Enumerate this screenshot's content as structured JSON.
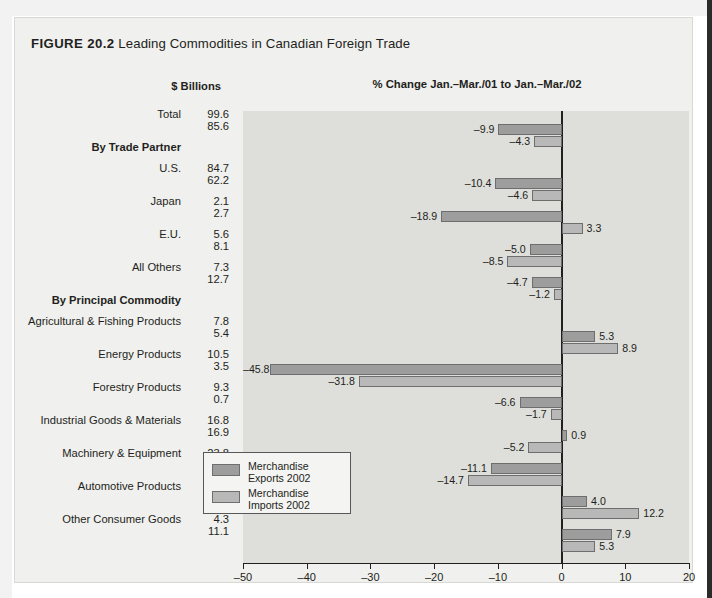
{
  "figure": {
    "number": "FIGURE 20.2",
    "title": "Leading Commodities in Canadian Foreign Trade",
    "chart_header": "% Change  Jan.–Mar./01 to Jan.–Mar./02",
    "units_header": "$ Billions"
  },
  "legend": {
    "position": "inside-left",
    "items": [
      {
        "label_line1": "Merchandise",
        "label_line2": "Exports 2002",
        "color": "#9d9d9d",
        "key": "exports"
      },
      {
        "label_line1": "Merchandise",
        "label_line2": "Imports 2002",
        "color": "#b8b8b8",
        "key": "imports"
      }
    ]
  },
  "chart_data": {
    "type": "bar",
    "orientation": "horizontal",
    "title": "Leading Commodities in Canadian Foreign Trade",
    "subtitle": "% Change  Jan.–Mar./01 to Jan.–Mar./02",
    "xlabel": "",
    "ylabel": "",
    "xlim": [
      -50,
      20
    ],
    "xticks": [
      -50,
      -40,
      -30,
      -20,
      -10,
      0,
      10,
      20
    ],
    "xticklabels": [
      "–50",
      "–40",
      "–30",
      "–20",
      "–10",
      "0",
      "10",
      "20"
    ],
    "grid": false,
    "legend_position": "inside-left",
    "value_column_header": "$ Billions",
    "series": [
      {
        "name": "Merchandise Exports 2002",
        "color": "#9d9d9d"
      },
      {
        "name": "Merchandise Imports 2002",
        "color": "#b8b8b8"
      }
    ],
    "sections": [
      {
        "heading": "",
        "rows": [
          {
            "category": "Total",
            "billions_exports": "99.6",
            "billions_imports": "85.6",
            "pct_exports": -9.9,
            "pct_imports": -4.3,
            "label_exports": "–9.9",
            "label_imports": "–4.3"
          }
        ]
      },
      {
        "heading": "By Trade Partner",
        "rows": [
          {
            "category": "U.S.",
            "billions_exports": "84.7",
            "billions_imports": "62.2",
            "pct_exports": -10.4,
            "pct_imports": -4.6,
            "label_exports": "–10.4",
            "label_imports": "–4.6"
          },
          {
            "category": "Japan",
            "billions_exports": "2.1",
            "billions_imports": "2.7",
            "pct_exports": -18.9,
            "pct_imports": 3.3,
            "label_exports": "–18.9",
            "label_imports": "3.3"
          },
          {
            "category": "E.U.",
            "billions_exports": "5.6",
            "billions_imports": "8.1",
            "pct_exports": -5.0,
            "pct_imports": -8.5,
            "label_exports": "–5.0",
            "label_imports": "–8.5"
          },
          {
            "category": "All Others",
            "billions_exports": "7.3",
            "billions_imports": "12.7",
            "pct_exports": -4.7,
            "pct_imports": -1.2,
            "label_exports": "–4.7",
            "label_imports": "–1.2"
          }
        ]
      },
      {
        "heading": "By Principal Commodity",
        "rows": [
          {
            "category": "Agricultural & Fishing Products",
            "billions_exports": "7.8",
            "billions_imports": "5.4",
            "pct_exports": 5.3,
            "pct_imports": 8.9,
            "label_exports": "5.3",
            "label_imports": "8.9"
          },
          {
            "category": "Energy Products",
            "billions_exports": "10.5",
            "billions_imports": "3.5",
            "pct_exports": -45.8,
            "pct_imports": -31.8,
            "label_exports": "–45.8",
            "label_imports": "–31.8"
          },
          {
            "category": "Forestry Products",
            "billions_exports": "9.3",
            "billions_imports": "0.7",
            "pct_exports": -6.6,
            "pct_imports": -1.7,
            "label_exports": "–6.6",
            "label_imports": "–1.7"
          },
          {
            "category": "Industrial Goods & Materials",
            "billions_exports": "16.8",
            "billions_imports": "16.9",
            "pct_exports": 0.9,
            "pct_imports": -5.2,
            "label_exports": "0.9",
            "label_imports": "–5.2"
          },
          {
            "category": "Machinery & Equipment",
            "billions_exports": "23.8",
            "billions_imports": "25.7",
            "pct_exports": -11.1,
            "pct_imports": -14.7,
            "label_exports": "–11.1",
            "label_imports": "–14.7"
          },
          {
            "category": "Automotive Products",
            "billions_exports": "23.4",
            "billions_imports": "19.1",
            "pct_exports": 4.0,
            "pct_imports": 12.2,
            "label_exports": "4.0",
            "label_imports": "12.2"
          },
          {
            "category": "Other Consumer Goods",
            "billions_exports": "4.3",
            "billions_imports": "11.1",
            "pct_exports": 7.9,
            "pct_imports": 5.3,
            "label_exports": "7.9",
            "label_imports": "5.3"
          }
        ]
      }
    ]
  }
}
